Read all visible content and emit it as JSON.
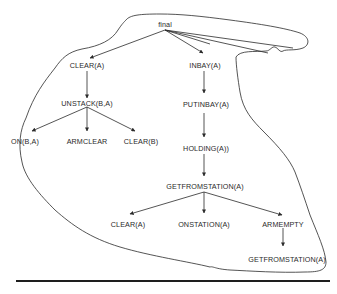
{
  "diagram": {
    "type": "goal-tree",
    "root": "final",
    "nodes": {
      "final": "final",
      "clear_a_1": "CLEAR(A)",
      "inbay_a": "INBAY(A)",
      "unstack_b_a": "UNSTACK(B,A)",
      "on_b_a": "ON(B,A)",
      "armclear": "ARMCLEAR",
      "clear_b": "CLEAR(B)",
      "putinbay_a": "PUTINBAY(A)",
      "holding_a": "HOLDING(A))",
      "getfromstation_a_1": "GETFROMSTATION(A)",
      "clear_a_2": "CLEAR(A)",
      "onstation_a": "ONSTATION(A)",
      "armempty": "ARMEMPTY",
      "getfromstation_a_2": "GETFROMSTATION(A)"
    },
    "edges": [
      [
        "final",
        "clear_a_1"
      ],
      [
        "final",
        "inbay_a"
      ],
      [
        "clear_a_1",
        "unstack_b_a"
      ],
      [
        "unstack_b_a",
        "on_b_a"
      ],
      [
        "unstack_b_a",
        "armclear"
      ],
      [
        "unstack_b_a",
        "clear_b"
      ],
      [
        "inbay_a",
        "putinbay_a"
      ],
      [
        "putinbay_a",
        "holding_a"
      ],
      [
        "holding_a",
        "getfromstation_a_1"
      ],
      [
        "getfromstation_a_1",
        "clear_a_2"
      ],
      [
        "getfromstation_a_1",
        "onstation_a"
      ],
      [
        "getfromstation_a_1",
        "armempty"
      ],
      [
        "armempty",
        "getfromstation_a_2"
      ]
    ],
    "extra_unlabeled_branches_from_final": 3,
    "enclosing_boundary": "hand-drawn loop enclosing the tree",
    "colors": {
      "ink": "#2a2a2a",
      "background": "#ffffff"
    }
  }
}
